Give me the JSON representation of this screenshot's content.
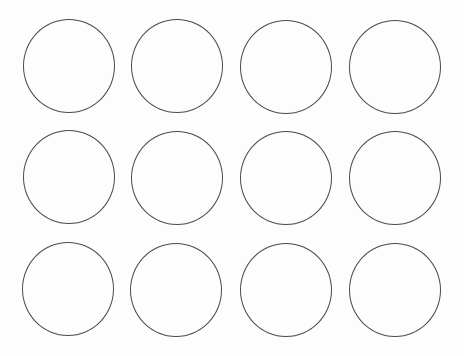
{
  "sheet": {
    "background": "#fdfdfd",
    "stroke_color": "#4a4a4a",
    "rows": 3,
    "columns": 4,
    "circles": [
      {
        "row": 1,
        "col": 1,
        "cx": 69,
        "cy": 66
      },
      {
        "row": 1,
        "col": 2,
        "cx": 177,
        "cy": 66
      },
      {
        "row": 1,
        "col": 3,
        "cx": 286,
        "cy": 67
      },
      {
        "row": 1,
        "col": 4,
        "cx": 395,
        "cy": 67
      },
      {
        "row": 2,
        "col": 1,
        "cx": 69,
        "cy": 177
      },
      {
        "row": 2,
        "col": 2,
        "cx": 177,
        "cy": 178
      },
      {
        "row": 2,
        "col": 3,
        "cx": 286,
        "cy": 178
      },
      {
        "row": 2,
        "col": 4,
        "cx": 395,
        "cy": 178
      },
      {
        "row": 3,
        "col": 1,
        "cx": 68,
        "cy": 289
      },
      {
        "row": 3,
        "col": 2,
        "cx": 176,
        "cy": 290
      },
      {
        "row": 3,
        "col": 3,
        "cx": 286,
        "cy": 290
      },
      {
        "row": 3,
        "col": 4,
        "cx": 395,
        "cy": 290
      }
    ]
  }
}
